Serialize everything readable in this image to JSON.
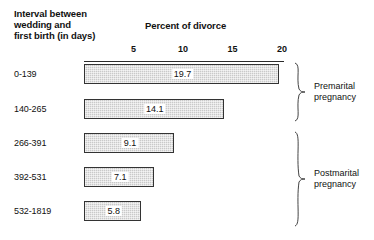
{
  "header": {
    "row_axis_title_lines": [
      "Interval between",
      "wedding and",
      "first birth (in days)"
    ],
    "value_axis_title": "Percent of divorce"
  },
  "chart_data": {
    "type": "bar",
    "orientation": "horizontal",
    "title": "",
    "xlabel": "Percent of divorce",
    "ylabel": "Interval between wedding and first birth (in days)",
    "categories": [
      "0-139",
      "140-265",
      "266-391",
      "392-531",
      "532-1819"
    ],
    "values": [
      19.7,
      14.1,
      9.1,
      7.1,
      5.8
    ],
    "value_labels": [
      "19.7",
      "14.1",
      "9.1",
      "7.1",
      "5.8"
    ],
    "xlim": [
      0,
      20
    ],
    "xticks": [
      5,
      10,
      15,
      20
    ],
    "xtick_labels": [
      "5",
      "10",
      "15",
      "20"
    ],
    "grid": false,
    "legend": "none",
    "annotations": [
      {
        "label_lines": [
          "Premarital",
          "pregnancy"
        ],
        "categories": [
          "0-139",
          "140-265"
        ]
      },
      {
        "label_lines": [
          "Postmarital",
          "pregnancy"
        ],
        "categories": [
          "266-391",
          "392-531",
          "532-1819"
        ]
      }
    ],
    "colors": {
      "bar_fill": "#c9c9c9",
      "bar_border": "#333333",
      "text": "#111111",
      "background": "#ffffff"
    }
  }
}
